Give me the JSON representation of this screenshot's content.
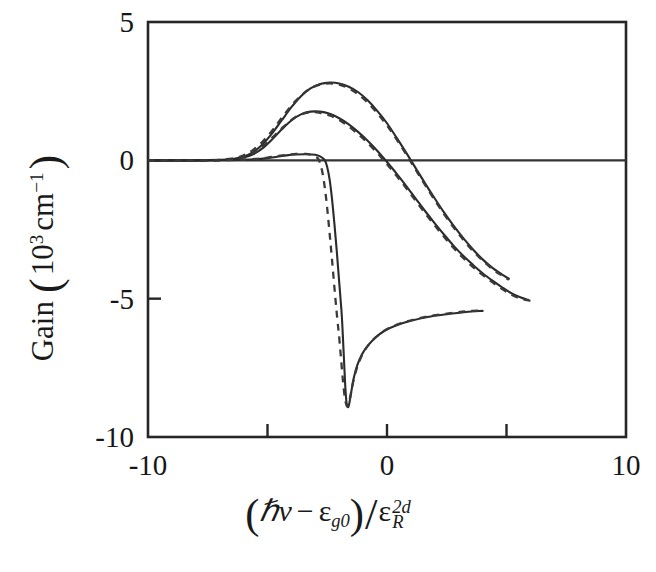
{
  "figure": {
    "background_color": "#ffffff",
    "ink_color": "#262626"
  },
  "axes": {
    "x_label_parts": {
      "open_paren": "(",
      "hbar": "ℏ",
      "nu": "ν",
      "minus": "−",
      "epsilon_g": "ε",
      "sub_g0": "g0",
      "close_paren": ")",
      "slash": "/",
      "epsilon_R": "ε",
      "sup_2d": "2d",
      "sub_R": "R"
    },
    "x_label_plain": "(ℏν − εg0)/εR2d",
    "y_label_parts": {
      "name": "Gain",
      "open_paren": "(",
      "ten": "10",
      "exp3": "3",
      "cm": "cm",
      "expm1": "−1",
      "close_paren": ")"
    },
    "y_label_plain": "Gain (10³ cm⁻¹)",
    "x_ticks": [
      {
        "value": -10,
        "label": "-10"
      },
      {
        "value": -5,
        "label": ""
      },
      {
        "value": 0,
        "label": "0"
      },
      {
        "value": 5,
        "label": ""
      },
      {
        "value": 10,
        "label": "10"
      }
    ],
    "y_ticks": [
      {
        "value": 5,
        "label": "5"
      },
      {
        "value": 0,
        "label": "0"
      },
      {
        "value": -5,
        "label": "-5"
      },
      {
        "value": -10,
        "label": "-10"
      }
    ],
    "xlim": [
      -10,
      10
    ],
    "ylim": [
      -10,
      5
    ],
    "frame": "box"
  },
  "chart_data": {
    "type": "line",
    "title": "",
    "xlabel": "(ℏν − εg0)/εR2d",
    "ylabel": "Gain (10³ cm⁻¹)",
    "xlim": [
      -10,
      10
    ],
    "ylim": [
      -10,
      5
    ],
    "grid": false,
    "legend": "none",
    "x_tick_labels": [
      "-10",
      "0",
      "10"
    ],
    "y_tick_labels": [
      "5",
      "0",
      "-5",
      "-10"
    ],
    "zero_reference_line": {
      "y": 0,
      "style": "solid",
      "color": "#333333"
    },
    "series": [
      {
        "name": "density-high-solid",
        "style": "solid",
        "color": "#2b2b2b",
        "points": [
          [
            -10.0,
            0.0
          ],
          [
            -8.0,
            0.0
          ],
          [
            -7.0,
            0.02
          ],
          [
            -6.4,
            0.06
          ],
          [
            -6.0,
            0.14
          ],
          [
            -5.6,
            0.3
          ],
          [
            -5.2,
            0.58
          ],
          [
            -4.8,
            0.98
          ],
          [
            -4.4,
            1.45
          ],
          [
            -4.0,
            1.92
          ],
          [
            -3.6,
            2.32
          ],
          [
            -3.2,
            2.6
          ],
          [
            -2.8,
            2.76
          ],
          [
            -2.4,
            2.81
          ],
          [
            -2.0,
            2.78
          ],
          [
            -1.6,
            2.66
          ],
          [
            -1.2,
            2.46
          ],
          [
            -0.8,
            2.16
          ],
          [
            -0.4,
            1.78
          ],
          [
            0.0,
            1.34
          ],
          [
            0.4,
            0.82
          ],
          [
            0.8,
            0.28
          ],
          [
            1.0,
            0.0
          ],
          [
            1.2,
            -0.28
          ],
          [
            1.6,
            -0.84
          ],
          [
            2.0,
            -1.38
          ],
          [
            2.4,
            -1.9
          ],
          [
            2.8,
            -2.38
          ],
          [
            3.2,
            -2.82
          ],
          [
            3.6,
            -3.22
          ],
          [
            4.0,
            -3.58
          ],
          [
            4.4,
            -3.88
          ],
          [
            4.8,
            -4.12
          ],
          [
            5.1,
            -4.28
          ]
        ]
      },
      {
        "name": "density-high-dashed",
        "style": "dashed",
        "color": "#3a3a3a",
        "points": [
          [
            -10.0,
            0.0
          ],
          [
            -8.0,
            0.0
          ],
          [
            -7.0,
            0.02
          ],
          [
            -6.4,
            0.08
          ],
          [
            -6.0,
            0.18
          ],
          [
            -5.6,
            0.38
          ],
          [
            -5.2,
            0.68
          ],
          [
            -4.8,
            1.08
          ],
          [
            -4.4,
            1.54
          ],
          [
            -4.0,
            1.98
          ],
          [
            -3.6,
            2.34
          ],
          [
            -3.2,
            2.6
          ],
          [
            -2.8,
            2.74
          ],
          [
            -2.4,
            2.78
          ],
          [
            -2.0,
            2.74
          ],
          [
            -1.6,
            2.6
          ],
          [
            -1.2,
            2.38
          ],
          [
            -0.8,
            2.08
          ],
          [
            -0.4,
            1.7
          ],
          [
            0.0,
            1.26
          ],
          [
            0.4,
            0.76
          ],
          [
            0.8,
            0.22
          ],
          [
            1.0,
            -0.06
          ],
          [
            1.2,
            -0.34
          ],
          [
            1.6,
            -0.9
          ],
          [
            2.0,
            -1.44
          ],
          [
            2.4,
            -1.96
          ],
          [
            2.8,
            -2.44
          ],
          [
            3.2,
            -2.88
          ],
          [
            3.6,
            -3.28
          ],
          [
            4.0,
            -3.62
          ],
          [
            4.4,
            -3.92
          ],
          [
            4.8,
            -4.16
          ],
          [
            5.1,
            -4.32
          ]
        ]
      },
      {
        "name": "density-mid-solid",
        "style": "solid",
        "color": "#2b2b2b",
        "points": [
          [
            -10.0,
            0.0
          ],
          [
            -8.0,
            0.0
          ],
          [
            -7.0,
            0.01
          ],
          [
            -6.4,
            0.04
          ],
          [
            -6.0,
            0.1
          ],
          [
            -5.6,
            0.22
          ],
          [
            -5.2,
            0.44
          ],
          [
            -4.8,
            0.76
          ],
          [
            -4.4,
            1.12
          ],
          [
            -4.0,
            1.44
          ],
          [
            -3.6,
            1.66
          ],
          [
            -3.2,
            1.76
          ],
          [
            -2.8,
            1.76
          ],
          [
            -2.4,
            1.68
          ],
          [
            -2.0,
            1.52
          ],
          [
            -1.6,
            1.3
          ],
          [
            -1.2,
            1.02
          ],
          [
            -0.8,
            0.7
          ],
          [
            -0.4,
            0.34
          ],
          [
            -0.1,
            0.04
          ],
          [
            0.0,
            -0.06
          ],
          [
            0.4,
            -0.48
          ],
          [
            0.8,
            -0.92
          ],
          [
            1.2,
            -1.38
          ],
          [
            1.6,
            -1.84
          ],
          [
            2.0,
            -2.28
          ],
          [
            2.4,
            -2.7
          ],
          [
            2.8,
            -3.1
          ],
          [
            3.2,
            -3.46
          ],
          [
            3.6,
            -3.78
          ],
          [
            4.0,
            -4.08
          ],
          [
            4.4,
            -4.34
          ],
          [
            4.8,
            -4.58
          ],
          [
            5.2,
            -4.8
          ],
          [
            5.6,
            -4.96
          ],
          [
            5.9,
            -5.04
          ]
        ]
      },
      {
        "name": "density-mid-dashed",
        "style": "dashed",
        "color": "#3a3a3a",
        "points": [
          [
            -10.0,
            0.0
          ],
          [
            -8.0,
            0.0
          ],
          [
            -7.0,
            0.01
          ],
          [
            -6.4,
            0.05
          ],
          [
            -6.0,
            0.12
          ],
          [
            -5.6,
            0.26
          ],
          [
            -5.2,
            0.5
          ],
          [
            -4.8,
            0.82
          ],
          [
            -4.4,
            1.16
          ],
          [
            -4.0,
            1.46
          ],
          [
            -3.6,
            1.66
          ],
          [
            -3.2,
            1.74
          ],
          [
            -2.8,
            1.72
          ],
          [
            -2.4,
            1.62
          ],
          [
            -2.0,
            1.46
          ],
          [
            -1.6,
            1.22
          ],
          [
            -1.2,
            0.94
          ],
          [
            -0.8,
            0.62
          ],
          [
            -0.4,
            0.26
          ],
          [
            -0.2,
            0.06
          ],
          [
            0.0,
            -0.14
          ],
          [
            0.4,
            -0.56
          ],
          [
            0.8,
            -1.0
          ],
          [
            1.2,
            -1.46
          ],
          [
            1.6,
            -1.92
          ],
          [
            2.0,
            -2.36
          ],
          [
            2.4,
            -2.78
          ],
          [
            2.8,
            -3.18
          ],
          [
            3.2,
            -3.54
          ],
          [
            3.6,
            -3.86
          ],
          [
            4.0,
            -4.14
          ],
          [
            4.4,
            -4.4
          ],
          [
            4.8,
            -4.64
          ],
          [
            5.2,
            -4.86
          ],
          [
            5.6,
            -5.0
          ],
          [
            6.0,
            -5.08
          ]
        ]
      },
      {
        "name": "density-low-solid",
        "style": "solid",
        "color": "#2b2b2b",
        "points": [
          [
            -10.0,
            0.0
          ],
          [
            -8.0,
            0.0
          ],
          [
            -6.5,
            0.01
          ],
          [
            -5.5,
            0.04
          ],
          [
            -5.0,
            0.08
          ],
          [
            -4.6,
            0.13
          ],
          [
            -4.2,
            0.18
          ],
          [
            -3.8,
            0.21
          ],
          [
            -3.4,
            0.22
          ],
          [
            -3.0,
            0.2
          ],
          [
            -2.8,
            0.14
          ],
          [
            -2.6,
            0.0
          ],
          [
            -2.5,
            -0.25
          ],
          [
            -2.4,
            -0.7
          ],
          [
            -2.3,
            -1.4
          ],
          [
            -2.2,
            -2.3
          ],
          [
            -2.1,
            -3.3
          ],
          [
            -2.0,
            -4.4
          ],
          [
            -1.9,
            -5.5
          ],
          [
            -1.85,
            -6.3
          ],
          [
            -1.8,
            -7.2
          ],
          [
            -1.75,
            -8.1
          ],
          [
            -1.7,
            -8.7
          ],
          [
            -1.64,
            -8.92
          ],
          [
            -1.58,
            -8.8
          ],
          [
            -1.5,
            -8.4
          ],
          [
            -1.4,
            -7.9
          ],
          [
            -1.25,
            -7.42
          ],
          [
            -1.05,
            -7.02
          ],
          [
            -0.8,
            -6.7
          ],
          [
            -0.5,
            -6.42
          ],
          [
            -0.1,
            -6.16
          ],
          [
            0.4,
            -5.96
          ],
          [
            1.0,
            -5.8
          ],
          [
            1.7,
            -5.66
          ],
          [
            2.5,
            -5.56
          ],
          [
            3.3,
            -5.48
          ],
          [
            4.0,
            -5.44
          ]
        ]
      },
      {
        "name": "density-low-dashed",
        "style": "dashed",
        "color": "#3a3a3a",
        "points": [
          [
            -10.0,
            0.0
          ],
          [
            -8.0,
            0.0
          ],
          [
            -6.5,
            0.01
          ],
          [
            -5.5,
            0.05
          ],
          [
            -5.0,
            0.1
          ],
          [
            -4.6,
            0.15
          ],
          [
            -4.2,
            0.2
          ],
          [
            -3.8,
            0.23
          ],
          [
            -3.4,
            0.23
          ],
          [
            -3.1,
            0.18
          ],
          [
            -2.9,
            0.08
          ],
          [
            -2.8,
            -0.1
          ],
          [
            -2.7,
            -0.45
          ],
          [
            -2.6,
            -1.0
          ],
          [
            -2.5,
            -1.75
          ],
          [
            -2.4,
            -2.65
          ],
          [
            -2.3,
            -3.6
          ],
          [
            -2.2,
            -4.6
          ],
          [
            -2.1,
            -5.55
          ],
          [
            -2.0,
            -6.4
          ],
          [
            -1.92,
            -7.2
          ],
          [
            -1.84,
            -8.0
          ],
          [
            -1.76,
            -8.6
          ],
          [
            -1.68,
            -8.88
          ],
          [
            -1.6,
            -8.78
          ],
          [
            -1.5,
            -8.38
          ],
          [
            -1.38,
            -7.88
          ],
          [
            -1.22,
            -7.4
          ],
          [
            -1.02,
            -7.0
          ],
          [
            -0.78,
            -6.68
          ],
          [
            -0.48,
            -6.4
          ],
          [
            -0.08,
            -6.14
          ],
          [
            0.42,
            -5.94
          ],
          [
            1.02,
            -5.78
          ],
          [
            1.72,
            -5.64
          ],
          [
            2.52,
            -5.54
          ],
          [
            3.32,
            -5.46
          ],
          [
            4.05,
            -5.42
          ]
        ]
      }
    ],
    "annotations": {
      "peak_high": {
        "x": -2.4,
        "y": 2.81
      },
      "peak_mid": {
        "x": -3.1,
        "y": 1.77
      },
      "trough_low": {
        "x": -1.64,
        "y": -8.92
      }
    }
  }
}
